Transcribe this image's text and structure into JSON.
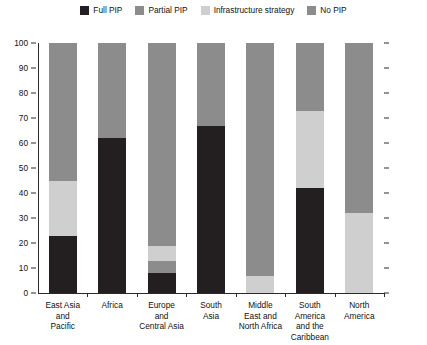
{
  "legend": {
    "position": "top-center",
    "items": [
      {
        "label": "Full PIP",
        "color": "#231f20",
        "name": "legend-full-pip"
      },
      {
        "label": "Partial PIP",
        "color": "#8c8c8c",
        "name": "legend-partial-pip"
      },
      {
        "label": "Infrastructure strategy",
        "color": "#cfcfcf",
        "name": "legend-infrastructure-strategy"
      },
      {
        "label": "No PIP",
        "color": "#8c8c8c",
        "name": "legend-no-pip"
      }
    ]
  },
  "yaxis": {
    "ticks": [
      "100",
      "90",
      "80",
      "70",
      "60",
      "50",
      "40",
      "30",
      "20",
      "10",
      "0"
    ],
    "min": 0,
    "max": 100
  },
  "xaxis": {
    "labels": [
      "East Asia\nand\nPacific",
      "Africa",
      "Europe\nand\nCentral Asia",
      "South\nAsia",
      "Middle\nEast and\nNorth Africa",
      "South\nAmerica\nand the\nCaribbean",
      "North\nAmerica"
    ]
  },
  "chart_data": {
    "type": "bar",
    "stacked": true,
    "title": "",
    "xlabel": "",
    "ylabel": "",
    "ylim": [
      0,
      100
    ],
    "grid": false,
    "legend_position": "top-center",
    "categories": [
      "East Asia and Pacific",
      "Africa",
      "Europe and Central Asia",
      "South Asia",
      "Middle East and North Africa",
      "South America and the Caribbean",
      "North America"
    ],
    "series": [
      {
        "name": "Full PIP",
        "color": "#231f20",
        "values": [
          23,
          62,
          8,
          67,
          0,
          42,
          0
        ]
      },
      {
        "name": "Partial PIP",
        "color": "#8c8c8c",
        "values": [
          0,
          0,
          5,
          0,
          0,
          0,
          0
        ]
      },
      {
        "name": "Infrastructure strategy",
        "color": "#cfcfcf",
        "values": [
          22,
          0,
          6,
          0,
          7,
          31,
          32
        ]
      },
      {
        "name": "No PIP",
        "color": "#8c8c8c",
        "values": [
          55,
          38,
          81,
          33,
          93,
          27,
          68
        ]
      }
    ]
  }
}
